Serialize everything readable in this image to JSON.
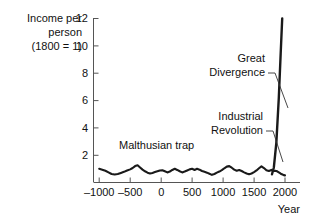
{
  "chart_data": {
    "type": "line",
    "title": "",
    "subtitle": "",
    "ylabel_lines": [
      "Income per",
      "person",
      "(1800 = 1)"
    ],
    "xlabel": "Year",
    "xlim": [
      -1000,
      2050
    ],
    "ylim": [
      0,
      12.6
    ],
    "grid": false,
    "legend": "none",
    "xticks": [
      -1000,
      -500,
      0,
      500,
      1000,
      1500,
      2000
    ],
    "xticklabels": [
      "–1000",
      "–500",
      "0",
      "500",
      "1000",
      "1500",
      "2000"
    ],
    "yticks": [
      2,
      4,
      6,
      8,
      10,
      12
    ],
    "yticklabels": [
      "2",
      "4",
      "6",
      "8",
      "10",
      "12"
    ],
    "series": [
      {
        "name": "Income per person (1800 = 1)",
        "color": "#1a1a1a",
        "x": [
          -1000,
          -950,
          -900,
          -850,
          -800,
          -750,
          -700,
          -650,
          -600,
          -550,
          -500,
          -460,
          -420,
          -380,
          -340,
          -300,
          -260,
          -220,
          -180,
          -140,
          -100,
          -60,
          -20,
          20,
          60,
          100,
          140,
          180,
          220,
          260,
          300,
          340,
          380,
          420,
          460,
          500,
          540,
          580,
          620,
          660,
          700,
          740,
          780,
          820,
          860,
          900,
          940,
          980,
          1020,
          1060,
          1100,
          1140,
          1180,
          1220,
          1260,
          1300,
          1340,
          1380,
          1420,
          1460,
          1500,
          1540,
          1580,
          1620,
          1660,
          1700,
          1740,
          1780,
          1800,
          1820,
          1840,
          1860,
          1880,
          1900,
          1920,
          1940,
          1960,
          1980,
          2000
        ],
        "y": [
          1.0,
          0.94,
          0.86,
          0.74,
          0.62,
          0.58,
          0.62,
          0.7,
          0.78,
          0.88,
          0.96,
          1.06,
          1.2,
          1.26,
          1.1,
          0.94,
          0.82,
          0.72,
          0.66,
          0.7,
          0.76,
          0.82,
          0.88,
          0.9,
          0.82,
          0.74,
          0.8,
          0.92,
          1.0,
          0.92,
          0.82,
          0.74,
          0.8,
          0.88,
          0.96,
          1.0,
          0.92,
          1.0,
          0.94,
          0.84,
          0.78,
          0.72,
          0.64,
          0.56,
          0.62,
          0.72,
          0.8,
          0.9,
          1.04,
          1.16,
          1.2,
          1.08,
          0.94,
          0.86,
          0.92,
          0.84,
          0.74,
          0.66,
          0.6,
          0.66,
          0.76,
          0.88,
          1.04,
          1.18,
          1.06,
          0.9,
          0.84,
          0.92,
          0.86,
          0.84,
          0.86,
          0.84,
          0.8,
          0.74,
          0.68,
          0.62,
          0.58,
          0.54,
          0.52
        ]
      },
      {
        "name": "Great Divergence spike",
        "color": "#1a1a1a",
        "x": [
          1790,
          1820,
          1860,
          1900,
          1930,
          1955
        ],
        "y": [
          0.6,
          1.1,
          2.9,
          6.2,
          9.4,
          12.0
        ]
      }
    ],
    "annotations": [
      {
        "id": "malthusian-trap",
        "text": "Malthusian trap",
        "text_x": 119,
        "text_y": 149,
        "anchor": "start",
        "leader": null
      },
      {
        "id": "great-divergence",
        "text_lines": [
          "Great",
          "Divergence"
        ],
        "text_x": 265,
        "text_y": 62,
        "anchor": "end",
        "leader": {
          "from_x": 268,
          "from_y": 78,
          "to_x": 286,
          "to_y": 108
        }
      },
      {
        "id": "industrial-revolution",
        "text_lines": [
          "Industrial",
          "Revolution"
        ],
        "text_x": 263,
        "text_y": 120,
        "anchor": "end",
        "leader": {
          "from_x": 266,
          "from_y": 135,
          "to_x": 280,
          "to_y": 160
        }
      }
    ]
  },
  "axes": {
    "axis_color": "#555555",
    "tick_color": "#555555",
    "text_color": "#111111"
  }
}
